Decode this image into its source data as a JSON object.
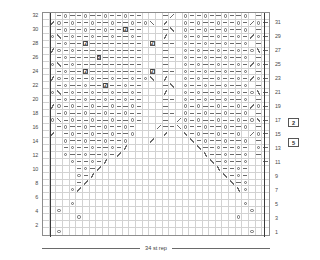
{
  "chart_data": {
    "type": "table",
    "title": "",
    "xlabel": "34 st rep",
    "ylabel": "",
    "grid": true,
    "columns": 34,
    "rows": 32,
    "legend_position": "right",
    "left_row_labels": [
      "32",
      "30",
      "28",
      "26",
      "24",
      "22",
      "20",
      "18",
      "16",
      "14",
      "12",
      "10",
      "8",
      "6",
      "4",
      "2"
    ],
    "right_row_labels": [
      "31",
      "29",
      "27",
      "25",
      "23",
      "21",
      "19",
      "17",
      "15",
      "13",
      "11",
      "9",
      "7",
      "5",
      "3",
      "1"
    ],
    "symbol_key": {
      "dash": "purl",
      "o": "yarn-over",
      "k2tog": "right-leaning-decrease",
      "ssk": "left-leaning-decrease",
      "num2": "boxed-2",
      "num5": "boxed-5"
    },
    "repeat_markers": [
      1,
      33
    ],
    "cells": [
      [
        ".",
        ".",
        "-",
        "o",
        "-",
        "-",
        "o",
        "-",
        "-",
        "o",
        "-",
        "-",
        "o",
        "-",
        "-",
        ".",
        ".",
        ".",
        "-",
        "ssk",
        ".",
        "o",
        "-",
        "-",
        "o",
        "-",
        "-",
        "o",
        "-",
        "-",
        "o",
        ".",
        "-",
        "."
      ],
      [
        ".",
        "ssk",
        "o",
        "-",
        "o",
        "-",
        "-",
        "o",
        "-",
        "-",
        "o",
        "-",
        "-",
        "o",
        "-",
        "o",
        "k2tog",
        ".",
        "ssk",
        ".",
        ".",
        "o",
        "-",
        "o",
        "-",
        "-",
        "o",
        "-",
        "-",
        "o",
        "-",
        "ssk",
        "o",
        "-"
      ],
      [
        ".",
        ".",
        "-",
        "o",
        "-",
        "-",
        "o",
        "-",
        "-",
        "o",
        "-",
        "-",
        "num2",
        "-",
        "-",
        ".",
        ".",
        ".",
        "-",
        "k2tog",
        ".",
        "o",
        "-",
        "-",
        "o",
        "-",
        "-",
        "o",
        "-",
        "-",
        "o",
        ".",
        "-",
        "."
      ],
      [
        ".",
        "o",
        "k2tog",
        "-",
        "o",
        "-",
        "-",
        "o",
        "-",
        "-",
        "o",
        "-",
        "-",
        "o",
        "-",
        ".",
        ".",
        ".",
        "ssk",
        ".",
        ".",
        "o",
        "-",
        "o",
        "-",
        "-",
        "o",
        "-",
        "-",
        "o",
        "-",
        "ssk",
        "o",
        "-"
      ],
      [
        ".",
        ".",
        "-",
        "o",
        "-",
        "-",
        "num2",
        "-",
        "-",
        "-",
        "-",
        "-",
        "-",
        "-",
        "-",
        ".",
        "num2",
        ".",
        "-",
        "-",
        ".",
        "o",
        "-",
        "-",
        "o",
        "-",
        "-",
        "o",
        "-",
        "-",
        "o",
        ".",
        "-",
        "."
      ],
      [
        ".",
        "ssk",
        "o",
        "-",
        "o",
        "-",
        "-",
        "-",
        "-",
        "-",
        "-",
        "-",
        "-",
        "-",
        "-",
        ".",
        ".",
        ".",
        "-",
        ".",
        ".",
        "o",
        "-",
        "o",
        "-",
        "-",
        "o",
        "-",
        "-",
        "o",
        "-",
        "o",
        "k2tog",
        "-"
      ],
      [
        ".",
        ".",
        "-",
        "o",
        "-",
        "-",
        "-",
        "-",
        "num5",
        "-",
        "-",
        "-",
        "-",
        "-",
        "-",
        ".",
        ".",
        ".",
        "-",
        "-",
        ".",
        "o",
        "-",
        "-",
        "o",
        "-",
        "-",
        "o",
        "-",
        "-",
        "o",
        ".",
        "-",
        "."
      ],
      [
        ".",
        "o",
        "k2tog",
        "-",
        "o",
        "-",
        "-",
        "-",
        "-",
        "-",
        "-",
        "-",
        "-",
        "-",
        "-",
        ".",
        ".",
        ".",
        "-",
        ".",
        ".",
        "o",
        "-",
        "o",
        "-",
        "-",
        "o",
        "-",
        "-",
        "o",
        "-",
        "ssk",
        "o",
        "-"
      ],
      [
        ".",
        ".",
        "-",
        "o",
        "-",
        "-",
        "num2",
        "-",
        "-",
        "-",
        "-",
        "-",
        "-",
        "-",
        "-",
        ".",
        "num2",
        ".",
        "-",
        "-",
        ".",
        "o",
        "-",
        "-",
        "o",
        "-",
        "-",
        "o",
        "-",
        "-",
        "o",
        ".",
        "-",
        "."
      ],
      [
        ".",
        "ssk",
        "o",
        "-",
        "o",
        "-",
        "-",
        "o",
        "-",
        "-",
        "o",
        "-",
        "-",
        "o",
        "-",
        "o",
        "k2tog",
        ".",
        "ssk",
        ".",
        ".",
        "o",
        "-",
        "o",
        "-",
        "-",
        "o",
        "-",
        "-",
        "o",
        "-",
        "ssk",
        "o",
        "-"
      ],
      [
        ".",
        ".",
        "-",
        "o",
        "-",
        "-",
        "o",
        "-",
        "-",
        "num2",
        "-",
        "-",
        "o",
        "-",
        "-",
        ".",
        ".",
        ".",
        "-",
        "k2tog",
        ".",
        "o",
        "-",
        "-",
        "o",
        "-",
        "-",
        "o",
        "-",
        "-",
        "o",
        ".",
        "-",
        "."
      ],
      [
        ".",
        "o",
        "k2tog",
        "-",
        "o",
        "-",
        "-",
        "o",
        "-",
        "-",
        "o",
        "-",
        "-",
        "o",
        "-",
        ".",
        ".",
        ".",
        "ssk",
        ".",
        ".",
        "o",
        "-",
        "o",
        "-",
        "-",
        "o",
        "-",
        "-",
        "o",
        "-",
        "o",
        "k2tog",
        "-"
      ],
      [
        ".",
        ".",
        "-",
        "o",
        "-",
        "-",
        "o",
        "-",
        "-",
        "o",
        "-",
        "-",
        "o",
        "-",
        "-",
        ".",
        ".",
        ".",
        "-",
        "-",
        ".",
        "o",
        "-",
        "-",
        "o",
        "-",
        "-",
        "o",
        "-",
        "-",
        "o",
        ".",
        "-",
        "."
      ],
      [
        ".",
        "ssk",
        "o",
        "-",
        "o",
        "-",
        "-",
        "o",
        "-",
        "-",
        "o",
        "-",
        "-",
        "o",
        "-",
        ".",
        ".",
        ".",
        "-",
        ".",
        ".",
        "o",
        "-",
        "o",
        "-",
        "-",
        "o",
        "-",
        "-",
        "o",
        "-",
        "ssk",
        "o",
        "-"
      ],
      [
        ".",
        ".",
        "-",
        "o",
        "-",
        "-",
        "o",
        "-",
        "-",
        "o",
        "-",
        "-",
        "o",
        "-",
        "-",
        ".",
        ".",
        ".",
        "-",
        "-",
        ".",
        "o",
        "-",
        "-",
        "o",
        "-",
        "-",
        "o",
        "-",
        "-",
        "o",
        ".",
        "-",
        "."
      ],
      [
        ".",
        "o",
        "k2tog",
        "-",
        "o",
        "-",
        "-",
        "o",
        "-",
        "-",
        "o",
        "-",
        "-",
        "o",
        "-",
        ".",
        ".",
        ".",
        "-",
        ".",
        "ssk",
        "o",
        "-",
        "o",
        "-",
        "-",
        "o",
        "-",
        "-",
        "o",
        "-",
        "o",
        "k2tog",
        "-"
      ],
      [
        ".",
        ".",
        "-",
        "o",
        "-",
        "-",
        "o",
        "-",
        "-",
        "o",
        "-",
        "-",
        "o",
        "-",
        ".",
        ".",
        ".",
        "ssk",
        "-",
        "-",
        "k2tog",
        "o",
        "-",
        "-",
        "o",
        "-",
        "-",
        "o",
        "-",
        "-",
        "o",
        ".",
        "-",
        "."
      ],
      [
        ".",
        "ssk",
        ".",
        "-",
        "o",
        "-",
        "-",
        "o",
        "-",
        "-",
        "o",
        "-",
        "-",
        "o",
        ".",
        ".",
        ".",
        ".",
        "ssk",
        ".",
        ".",
        "k2tog",
        "-",
        "o",
        "-",
        "-",
        "o",
        "-",
        "-",
        "o",
        ".",
        "ssk",
        "o",
        "-"
      ],
      [
        ".",
        ".",
        ".",
        "o",
        "-",
        "-",
        "o",
        "-",
        "-",
        "o",
        "-",
        "-",
        "o",
        ".",
        ".",
        ".",
        "ssk",
        ".",
        ".",
        ".",
        ".",
        ".",
        "k2tog",
        "-",
        "o",
        "-",
        "-",
        "o",
        "-",
        "-",
        "o",
        ".",
        "-",
        "."
      ],
      [
        ".",
        ".",
        ".",
        "-",
        "o",
        "-",
        "-",
        "o",
        "-",
        "-",
        "o",
        "-",
        "ssk",
        ".",
        ".",
        ".",
        ".",
        ".",
        ".",
        ".",
        ".",
        ".",
        ".",
        "k2tog",
        "-",
        "-",
        "o",
        "-",
        "-",
        "o",
        "-",
        ".",
        "o",
        "-"
      ],
      [
        ".",
        ".",
        ".",
        "o",
        "-",
        "-",
        "o",
        "-",
        "-",
        "o",
        "-",
        "ssk",
        ".",
        ".",
        ".",
        ".",
        ".",
        ".",
        ".",
        ".",
        ".",
        ".",
        ".",
        ".",
        "k2tog",
        "-",
        "-",
        "o",
        "-",
        "-",
        "o",
        ".",
        "-",
        "."
      ],
      [
        ".",
        ".",
        ".",
        ".",
        "o",
        "-",
        "-",
        "o",
        "-",
        "ssk",
        ".",
        ".",
        ".",
        ".",
        ".",
        ".",
        ".",
        ".",
        ".",
        ".",
        ".",
        ".",
        ".",
        ".",
        ".",
        "k2tog",
        "-",
        "o",
        "-",
        "-",
        "o",
        ".",
        ".",
        "-"
      ],
      [
        ".",
        ".",
        ".",
        ".",
        ".",
        "-",
        "o",
        "-",
        "ssk",
        ".",
        ".",
        ".",
        ".",
        ".",
        ".",
        ".",
        ".",
        ".",
        ".",
        ".",
        ".",
        ".",
        ".",
        ".",
        ".",
        ".",
        "k2tog",
        "-",
        "-",
        "o",
        "-",
        ".",
        ".",
        "."
      ],
      [
        ".",
        ".",
        ".",
        ".",
        ".",
        "o",
        "-",
        "ssk",
        ".",
        ".",
        ".",
        ".",
        ".",
        ".",
        ".",
        ".",
        ".",
        ".",
        ".",
        ".",
        ".",
        ".",
        ".",
        ".",
        ".",
        ".",
        ".",
        "k2tog",
        "-",
        "o",
        "-",
        ".",
        ".",
        "."
      ],
      [
        ".",
        ".",
        ".",
        ".",
        ".",
        "-",
        "ssk",
        ".",
        ".",
        ".",
        ".",
        ".",
        ".",
        ".",
        ".",
        ".",
        ".",
        ".",
        ".",
        ".",
        ".",
        ".",
        ".",
        ".",
        ".",
        ".",
        ".",
        ".",
        "k2tog",
        "-",
        "o",
        ".",
        ".",
        "."
      ],
      [
        ".",
        ".",
        ".",
        ".",
        "o",
        "ssk",
        ".",
        ".",
        ".",
        ".",
        ".",
        ".",
        ".",
        ".",
        ".",
        ".",
        ".",
        ".",
        ".",
        ".",
        ".",
        ".",
        ".",
        ".",
        ".",
        ".",
        ".",
        ".",
        ".",
        "k2tog",
        "o",
        ".",
        ".",
        "."
      ],
      [
        ".",
        ".",
        ".",
        ".",
        ".",
        ".",
        ".",
        ".",
        ".",
        ".",
        ".",
        ".",
        ".",
        ".",
        ".",
        ".",
        ".",
        ".",
        ".",
        ".",
        ".",
        ".",
        ".",
        ".",
        ".",
        ".",
        ".",
        ".",
        ".",
        ".",
        ".",
        ".",
        ".",
        "."
      ],
      [
        ".",
        ".",
        ".",
        ".",
        "o",
        ".",
        ".",
        ".",
        ".",
        ".",
        ".",
        ".",
        ".",
        ".",
        ".",
        ".",
        ".",
        ".",
        ".",
        ".",
        ".",
        ".",
        ".",
        ".",
        ".",
        ".",
        ".",
        ".",
        ".",
        ".",
        "o",
        ".",
        ".",
        "."
      ],
      [
        ".",
        ".",
        "o",
        ".",
        ".",
        ".",
        ".",
        ".",
        ".",
        ".",
        ".",
        ".",
        ".",
        ".",
        ".",
        ".",
        ".",
        ".",
        ".",
        ".",
        ".",
        ".",
        ".",
        ".",
        ".",
        ".",
        ".",
        ".",
        ".",
        ".",
        ".",
        "o",
        ".",
        "."
      ],
      [
        ".",
        ".",
        ".",
        ".",
        ".",
        "o",
        ".",
        ".",
        ".",
        ".",
        ".",
        ".",
        ".",
        ".",
        ".",
        ".",
        ".",
        ".",
        ".",
        ".",
        ".",
        ".",
        ".",
        ".",
        ".",
        ".",
        ".",
        ".",
        ".",
        "o",
        ".",
        ".",
        ".",
        "."
      ],
      [
        ".",
        ".",
        ".",
        ".",
        ".",
        ".",
        ".",
        ".",
        ".",
        ".",
        ".",
        ".",
        ".",
        ".",
        ".",
        ".",
        ".",
        ".",
        ".",
        ".",
        ".",
        ".",
        ".",
        ".",
        ".",
        ".",
        ".",
        ".",
        ".",
        ".",
        ".",
        ".",
        ".",
        "."
      ],
      [
        ".",
        ".",
        "o",
        ".",
        ".",
        ".",
        ".",
        ".",
        ".",
        ".",
        ".",
        ".",
        ".",
        ".",
        ".",
        ".",
        ".",
        ".",
        ".",
        ".",
        ".",
        ".",
        ".",
        ".",
        ".",
        ".",
        ".",
        ".",
        ".",
        ".",
        ".",
        "o",
        ".",
        "."
      ]
    ]
  },
  "legend": {
    "items": [
      {
        "label": "2",
        "name": "legend-symbol-2"
      },
      {
        "label": "5",
        "name": "legend-symbol-5"
      }
    ]
  },
  "footer": {
    "repeat_label": "34 st rep"
  }
}
